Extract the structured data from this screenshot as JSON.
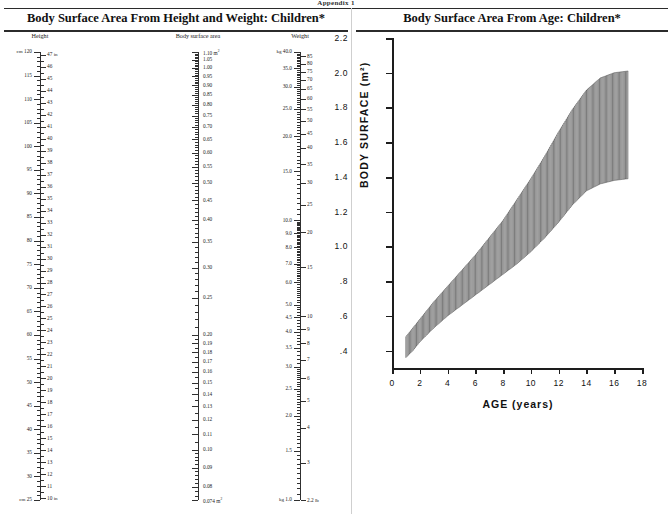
{
  "running_head": "Appendix 1",
  "panels": {
    "left_title": "Body Surface Area From Height and Weight: Children*",
    "right_title": "Body Surface Area From Age: Children*"
  },
  "nomogram": {
    "height_scale": {
      "heading": "Height",
      "unit_left": "cm",
      "unit_right": "in",
      "top_left_value": "120",
      "top_right_value": "47",
      "bottom_left_value": "25",
      "bottom_right_value": "10",
      "cm_labels": [
        "120",
        "115",
        "110",
        "105",
        "100",
        "95",
        "90",
        "85",
        "80",
        "75",
        "70",
        "65",
        "60",
        "55",
        "50",
        "45",
        "40",
        "35",
        "30",
        "25"
      ],
      "in_labels": [
        "47",
        "46",
        "45",
        "44",
        "43",
        "42",
        "41",
        "40",
        "39",
        "38",
        "37",
        "36",
        "35",
        "34",
        "33",
        "32",
        "31",
        "30",
        "29",
        "28",
        "27",
        "26",
        "25",
        "24",
        "23",
        "22",
        "21",
        "20",
        "19",
        "18",
        "17",
        "16",
        "15",
        "14",
        "13",
        "12",
        "11",
        "10"
      ],
      "cm_range": [
        25,
        120
      ],
      "in_range": [
        10,
        47
      ]
    },
    "bsa_scale": {
      "heading": "Body surface area",
      "unit": "m2",
      "top_value": "1.10",
      "bottom_value": "0.074",
      "labels": [
        "1.10",
        "1.05",
        "1.00",
        "0.95",
        "0.90",
        "0.85",
        "0.80",
        "0.75",
        "0.70",
        "0.65",
        "0.60",
        "0.55",
        "0.50",
        "0.45",
        "0.40",
        "0.35",
        "0.30",
        "0.25",
        "0.20",
        "0.19",
        "0.18",
        "0.17",
        "0.16",
        "0.15",
        "0.14",
        "0.13",
        "0.12",
        "0.11",
        "0.10",
        "0.09",
        "0.08",
        "0.074"
      ],
      "scale_type": "logarithmic"
    },
    "weight_scale": {
      "heading": "Weight",
      "unit_left": "kg",
      "unit_right": "lb",
      "top_left_value": "40.0",
      "top_right_value": "90",
      "bottom_left_value": "1.0",
      "bottom_right_value": "2.2",
      "kg_labels": [
        "40.0",
        "35.0",
        "30.0",
        "25.0",
        "20.0",
        "15.0",
        "10.0",
        "9.0",
        "8.0",
        "7.0",
        "6.0",
        "5.0",
        "4.5",
        "4.0",
        "3.5",
        "3.0",
        "2.5",
        "2.0",
        "1.5",
        "1.0"
      ],
      "lb_labels": [
        "90",
        "85",
        "80",
        "75",
        "70",
        "65",
        "60",
        "55",
        "50",
        "45",
        "40",
        "35",
        "30",
        "25",
        "20",
        "15",
        "10",
        "9",
        "8",
        "7",
        "6",
        "5",
        "4",
        "3",
        "2.2"
      ],
      "scale_type": "logarithmic"
    }
  },
  "chart_data": {
    "type": "area",
    "title": "Body Surface Area From Age: Children*",
    "xlabel": "AGE (years)",
    "ylabel": "BODY SURFACE (m²)",
    "xlim": [
      0,
      18
    ],
    "ylim": [
      0.3,
      2.2
    ],
    "xticks": [
      0,
      2,
      4,
      6,
      8,
      10,
      12,
      14,
      16,
      18
    ],
    "xtick_labels": [
      "0",
      "2",
      "4",
      "6",
      "8",
      "10",
      "12",
      "14",
      "16",
      "18"
    ],
    "yticks": [
      0.4,
      0.6,
      0.8,
      1.0,
      1.2,
      1.4,
      1.6,
      1.8,
      2.0,
      2.2
    ],
    "ytick_labels": [
      ".4",
      ".6",
      ".8",
      "1.0",
      "1.2",
      "1.4",
      "1.6",
      "1.8",
      "2.0",
      "2.2"
    ],
    "grid": false,
    "legend": null,
    "fill_style": "vertical-hatch",
    "x": [
      1,
      1.5,
      2,
      2.5,
      3,
      4,
      5,
      6,
      7,
      8,
      9,
      10,
      11,
      12,
      13,
      14,
      15,
      16,
      17
    ],
    "series": [
      {
        "name": "lower bound",
        "values": [
          0.36,
          0.4,
          0.45,
          0.49,
          0.53,
          0.6,
          0.66,
          0.72,
          0.78,
          0.84,
          0.9,
          0.97,
          1.05,
          1.14,
          1.24,
          1.32,
          1.36,
          1.38,
          1.39
        ]
      },
      {
        "name": "upper bound",
        "values": [
          0.48,
          0.53,
          0.58,
          0.63,
          0.68,
          0.77,
          0.86,
          0.95,
          1.05,
          1.15,
          1.27,
          1.39,
          1.52,
          1.66,
          1.79,
          1.9,
          1.97,
          2.0,
          2.01
        ]
      }
    ]
  }
}
